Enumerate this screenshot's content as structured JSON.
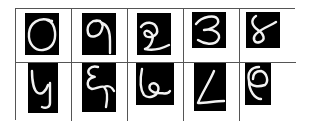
{
  "figure": {
    "layout": {
      "rows": 2,
      "cols": 5
    },
    "colors": {
      "cell_background": "#ffffff",
      "digit_background": "#000000",
      "stroke": "#f2f2f2",
      "grid_line": "#555555"
    },
    "cells": [
      {
        "row": 0,
        "col": 0,
        "label": "0"
      },
      {
        "row": 0,
        "col": 1,
        "label": "9"
      },
      {
        "row": 0,
        "col": 2,
        "label": "2"
      },
      {
        "row": 0,
        "col": 3,
        "label": "3"
      },
      {
        "row": 0,
        "col": 4,
        "label": "8"
      },
      {
        "row": 1,
        "col": 0,
        "label": "4"
      },
      {
        "row": 1,
        "col": 1,
        "label": "8"
      },
      {
        "row": 1,
        "col": 2,
        "label": "6"
      },
      {
        "row": 1,
        "col": 3,
        "label": "1"
      },
      {
        "row": 1,
        "col": 4,
        "label": "0"
      }
    ]
  }
}
